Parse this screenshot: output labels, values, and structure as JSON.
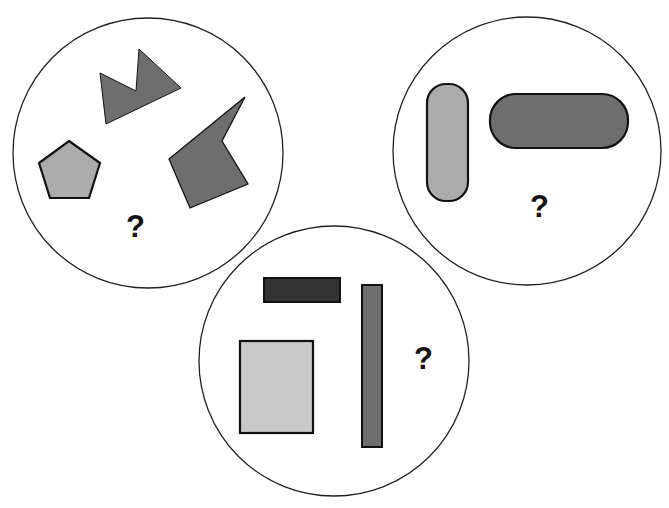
{
  "colors": {
    "background": "#ffffff",
    "circle_stroke": "#222222",
    "shape_stroke": "#111111",
    "light_gray": "#ababab",
    "medium_gray": "#6e6e6e",
    "dark_gray": "#333333",
    "lighter_gray": "#c9c9c9"
  },
  "groups": [
    {
      "name": "left-circle",
      "shapes": [
        "zigzag-polygon",
        "arrow-polygon",
        "pentagon"
      ],
      "question_mark": "?"
    },
    {
      "name": "right-circle",
      "shapes": [
        "vertical-rounded-bar",
        "horizontal-rounded-bar"
      ],
      "question_mark": "?"
    },
    {
      "name": "bottom-circle",
      "shapes": [
        "dark-horizontal-rectangle",
        "tall-narrow-rectangle",
        "light-rectangle"
      ],
      "question_mark": "?"
    }
  ]
}
